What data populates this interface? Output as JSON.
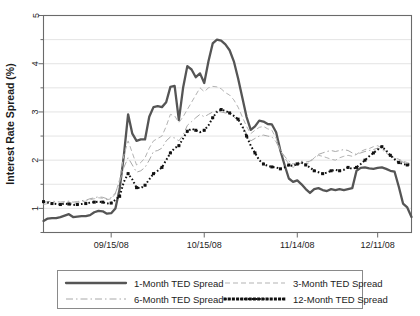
{
  "chart_data": {
    "type": "line",
    "title": "",
    "xlabel": "",
    "ylabel": "Interest Rate Spread (%)",
    "ylim": [
      0.5,
      5
    ],
    "yticks": [
      1,
      2,
      3,
      4,
      5
    ],
    "ytick_labels": [
      "1",
      "2",
      "3",
      "4",
      "5"
    ],
    "y_minor_ticks": [
      0.5,
      1.5,
      2.5,
      3.5,
      4.5
    ],
    "grid": true,
    "grid_axis": "y",
    "legend_position": "bottom",
    "legend_columns": 2,
    "xtick_labels": [
      "09/15/08",
      "10/15/08",
      "11/14/08",
      "12/11/08"
    ],
    "xtick_positions": [
      16,
      38,
      60,
      79
    ],
    "x": [
      0,
      1,
      2,
      3,
      4,
      5,
      6,
      7,
      8,
      9,
      10,
      11,
      12,
      13,
      14,
      15,
      16,
      17,
      18,
      19,
      20,
      21,
      22,
      23,
      24,
      25,
      26,
      27,
      28,
      29,
      30,
      31,
      32,
      33,
      34,
      35,
      36,
      37,
      38,
      39,
      40,
      41,
      42,
      43,
      44,
      45,
      46,
      47,
      48,
      49,
      50,
      51,
      52,
      53,
      54,
      55,
      56,
      57,
      58,
      59,
      60,
      61,
      62,
      63,
      64,
      65,
      66,
      67,
      68,
      69,
      70,
      71,
      72,
      73,
      74,
      75,
      76,
      77,
      78,
      79,
      80,
      81,
      82,
      83,
      84,
      85,
      86,
      87
    ],
    "series": [
      {
        "name": "1-Month TED Spread",
        "style": "solid-thick",
        "color": "#555555",
        "values": [
          0.74,
          0.79,
          0.8,
          0.8,
          0.82,
          0.85,
          0.88,
          0.82,
          0.83,
          0.84,
          0.84,
          0.86,
          0.92,
          0.95,
          0.94,
          0.89,
          0.9,
          1.0,
          1.4,
          2.1,
          2.95,
          2.55,
          2.4,
          2.43,
          2.43,
          2.9,
          3.1,
          3.12,
          3.1,
          3.2,
          3.52,
          3.54,
          2.83,
          3.5,
          3.95,
          3.88,
          3.72,
          3.8,
          3.6,
          4.05,
          4.42,
          4.5,
          4.48,
          4.4,
          4.28,
          4.05,
          3.7,
          3.3,
          2.9,
          2.63,
          2.7,
          2.82,
          2.8,
          2.75,
          2.74,
          2.58,
          2.2,
          1.9,
          1.62,
          1.55,
          1.58,
          1.5,
          1.4,
          1.32,
          1.4,
          1.42,
          1.38,
          1.36,
          1.4,
          1.38,
          1.4,
          1.38,
          1.4,
          1.42,
          1.78,
          1.84,
          1.85,
          1.83,
          1.82,
          1.84,
          1.85,
          1.82,
          1.78,
          1.76,
          1.45,
          1.1,
          1.02,
          0.82
        ]
      },
      {
        "name": "3-Month TED Spread",
        "style": "dashed-light",
        "color": "#b3b3b3",
        "values": [
          1.08,
          1.1,
          1.12,
          1.11,
          1.1,
          1.12,
          1.13,
          1.1,
          1.12,
          1.14,
          1.15,
          1.18,
          1.2,
          1.22,
          1.21,
          1.18,
          1.2,
          1.3,
          1.6,
          2.1,
          2.4,
          2.15,
          1.9,
          1.95,
          2.05,
          2.25,
          2.4,
          2.45,
          2.5,
          2.7,
          2.95,
          2.92,
          2.78,
          2.9,
          3.05,
          3.2,
          3.35,
          3.5,
          3.42,
          3.5,
          3.53,
          3.52,
          3.48,
          3.4,
          3.35,
          3.25,
          3.1,
          2.9,
          2.7,
          2.55,
          2.62,
          2.68,
          2.7,
          2.65,
          2.62,
          2.45,
          2.2,
          2.05,
          1.92,
          1.85,
          1.9,
          1.95,
          1.92,
          1.95,
          2.05,
          2.1,
          2.08,
          2.05,
          2.02,
          2.0,
          2.05,
          2.08,
          2.1,
          2.08,
          2.12,
          2.18,
          2.22,
          2.24,
          2.28,
          2.3,
          2.25,
          2.18,
          2.1,
          2.05,
          2.02,
          1.98,
          1.95,
          1.92
        ]
      },
      {
        "name": "6-Month TED Spread",
        "style": "dash-dot",
        "color": "#a8a8a8",
        "values": [
          1.12,
          1.14,
          1.15,
          1.14,
          1.13,
          1.14,
          1.15,
          1.13,
          1.14,
          1.16,
          1.17,
          1.2,
          1.22,
          1.24,
          1.23,
          1.2,
          1.22,
          1.32,
          1.55,
          1.85,
          2.05,
          1.9,
          1.75,
          1.78,
          1.85,
          2.0,
          2.18,
          2.2,
          2.25,
          2.4,
          2.48,
          2.46,
          2.4,
          2.52,
          2.72,
          2.8,
          2.88,
          2.95,
          2.9,
          2.95,
          3.0,
          3.02,
          3.0,
          2.98,
          2.95,
          2.9,
          2.82,
          2.7,
          2.55,
          2.4,
          2.45,
          2.5,
          2.52,
          2.5,
          2.48,
          2.38,
          2.2,
          2.08,
          1.98,
          1.92,
          1.95,
          1.98,
          1.96,
          1.98,
          2.05,
          2.12,
          2.15,
          2.18,
          2.2,
          2.18,
          2.2,
          2.22,
          2.2,
          2.15,
          2.12,
          2.15,
          2.18,
          2.2,
          2.22,
          2.25,
          2.22,
          2.15,
          2.08,
          2.04,
          2.0,
          1.96,
          1.94,
          1.92
        ]
      },
      {
        "name": "12-Month TED Spread",
        "style": "dotted-square",
        "color": "#111111",
        "values": [
          1.14,
          1.12,
          1.1,
          1.09,
          1.08,
          1.1,
          1.09,
          1.07,
          1.08,
          1.09,
          1.1,
          1.12,
          1.13,
          1.14,
          1.13,
          1.1,
          1.11,
          1.18,
          1.25,
          1.55,
          1.72,
          1.6,
          1.43,
          1.42,
          1.48,
          1.6,
          1.72,
          1.78,
          1.85,
          2.0,
          2.15,
          2.25,
          2.3,
          2.45,
          2.6,
          2.65,
          2.62,
          2.58,
          2.62,
          2.72,
          2.88,
          3.0,
          3.05,
          3.02,
          2.98,
          2.92,
          2.85,
          2.7,
          2.5,
          2.3,
          2.15,
          2.0,
          1.92,
          1.88,
          1.86,
          1.85,
          1.82,
          1.85,
          1.9,
          1.88,
          1.92,
          1.95,
          1.9,
          1.85,
          1.78,
          1.75,
          1.72,
          1.74,
          1.78,
          1.8,
          1.78,
          1.8,
          1.85,
          1.82,
          1.85,
          1.92,
          2.0,
          2.08,
          2.15,
          2.22,
          2.28,
          2.2,
          2.1,
          2.02,
          1.95,
          1.92,
          1.9,
          1.92
        ]
      }
    ]
  },
  "legend": {
    "items": [
      {
        "label": "1-Month TED Spread",
        "style": "solid-thick"
      },
      {
        "label": "3-Month TED Spread",
        "style": "dashed-light"
      },
      {
        "label": "6-Month TED Spread",
        "style": "dash-dot"
      },
      {
        "label": "12-Month TED Spread",
        "style": "dotted-square"
      }
    ]
  }
}
